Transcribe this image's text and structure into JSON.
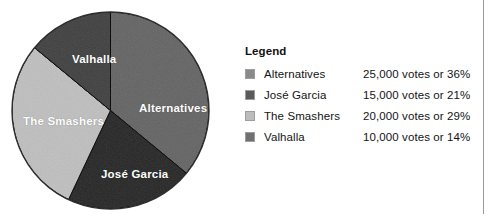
{
  "chart_data": {
    "type": "pie",
    "title": "",
    "legend_position": "right",
    "categories": [
      "Alternatives",
      "José Garcia",
      "The Smashers",
      "Valhalla"
    ],
    "values": [
      25000,
      15000,
      20000,
      10000
    ],
    "percentages": [
      36,
      21,
      29,
      14
    ],
    "value_unit": "votes",
    "total_votes": 70000,
    "colors": [
      "#8a8a8a",
      "#5a5a5a",
      "#bdbdbd",
      "#707070"
    ],
    "slices": [
      {
        "label": "Alternatives",
        "votes": 25000,
        "votes_text": "25,000",
        "percent": 36,
        "percent_text": "36%",
        "color": "#8a8a8a",
        "start_angle_deg": 0,
        "sweep_deg": 129.6
      },
      {
        "label": "José Garcia",
        "votes": 15000,
        "votes_text": "15,000",
        "percent": 21,
        "percent_text": "21%",
        "color": "#5a5a5a",
        "start_angle_deg": 129.6,
        "sweep_deg": 75.6
      },
      {
        "label": "The Smashers",
        "votes": 20000,
        "votes_text": "20,000",
        "percent": 29,
        "percent_text": "29%",
        "color": "#bdbdbd",
        "start_angle_deg": 205.2,
        "sweep_deg": 104.4
      },
      {
        "label": "Valhalla",
        "votes": 10000,
        "votes_text": "10,000",
        "percent": 14,
        "percent_text": "14%",
        "color": "#707070",
        "start_angle_deg": 309.6,
        "sweep_deg": 50.4
      }
    ]
  },
  "pie": {
    "labels": {
      "alternatives": "Alternatives",
      "jose_garcia": "José Garcia",
      "the_smashers": "The Smashers",
      "valhalla": "Valhalla"
    }
  },
  "legend": {
    "title": "Legend",
    "rows": [
      {
        "name": "Alternatives",
        "value": "25,000 votes or 36%",
        "color": "#8a8a8a"
      },
      {
        "name": "José Garcia",
        "value": "15,000 votes or 21%",
        "color": "#5a5a5a"
      },
      {
        "name": "The Smashers",
        "value": "20,000 votes or 29%",
        "color": "#bdbdbd"
      },
      {
        "name": "Valhalla",
        "value": "10,000 votes or 14%",
        "color": "#707070"
      }
    ]
  }
}
